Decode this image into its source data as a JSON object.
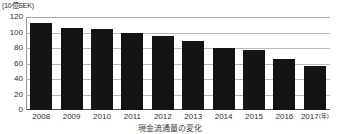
{
  "chart_data": {
    "type": "bar",
    "title": "",
    "caption": "現金流通量の変化",
    "unit_label": "(10億SEK)",
    "xlabel": "(年)",
    "ylabel": "",
    "ylim": [
      0,
      120
    ],
    "ytick_values": [
      120,
      100,
      80,
      60,
      40,
      20,
      0
    ],
    "yticks": [
      "120",
      "100",
      "80",
      "60",
      "40",
      "20",
      "0"
    ],
    "grid": true,
    "legend": "none",
    "categories": [
      "2008",
      "2009",
      "2010",
      "2011",
      "2012",
      "2013",
      "2014",
      "2015",
      "2016",
      "2017"
    ],
    "last_category_note": "(年)",
    "values": [
      112,
      106,
      104,
      99,
      96,
      89,
      80,
      78,
      66,
      57
    ],
    "bar_color": "#141414",
    "grid_color": "#b9b9b9",
    "axis_color": "#4a4a4a"
  }
}
